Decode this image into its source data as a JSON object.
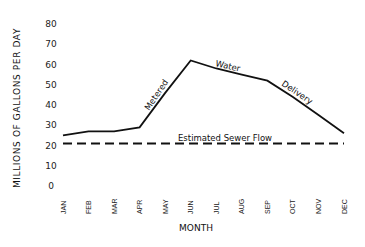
{
  "chart_data": {
    "type": "line",
    "title": "",
    "xlabel": "MONTH",
    "ylabel": "MILLIONS OF GALLONS PER DAY",
    "ylim": [
      0,
      80
    ],
    "yticks": [
      "0",
      "10",
      "20",
      "30",
      "40",
      "50",
      "60",
      "70",
      "80"
    ],
    "grid": false,
    "categories": [
      "JAN",
      "FEB",
      "MAR",
      "APR",
      "MAY",
      "JUN",
      "JUL",
      "AUG",
      "SEP",
      "OCT",
      "NOV",
      "DEC"
    ],
    "series": [
      {
        "name": "Metered Water Delivery",
        "style": "solid",
        "values": [
          25,
          27,
          27,
          29,
          46,
          62,
          58,
          55,
          52,
          44,
          35,
          26
        ]
      },
      {
        "name": "Estimated Sewer Flow",
        "style": "dashed",
        "values": [
          21,
          21,
          21,
          21,
          21,
          21,
          21,
          21,
          21,
          21,
          21,
          21
        ]
      }
    ],
    "annotations": [
      {
        "text": "Metered",
        "near": "APR-JUN"
      },
      {
        "text": "Water",
        "near": "JUN-AUG"
      },
      {
        "text": "Delivery",
        "near": "SEP-OCT"
      },
      {
        "text": "Estimated Sewer Flow",
        "near": "JUL-AUG, above dashed line"
      }
    ]
  }
}
